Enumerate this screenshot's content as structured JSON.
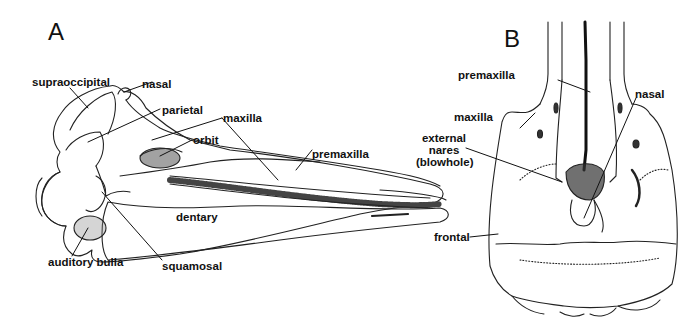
{
  "figure": {
    "panels": [
      {
        "id": "A",
        "view": "lateral",
        "labels": {
          "supraoccipital": "supraoccipital",
          "nasal": "nasal",
          "parietal": "parietal",
          "maxilla": "maxilla",
          "orbit": "orbit",
          "premaxilla": "premaxilla",
          "dentary": "dentary",
          "auditory_bulla": "auditory bulla",
          "squamosal": "squamosal"
        }
      },
      {
        "id": "B",
        "view": "dorsal",
        "labels": {
          "premaxilla": "premaxilla",
          "maxilla": "maxilla",
          "nasal": "nasal",
          "external_nares_1": "external",
          "external_nares_2": "nares",
          "external_nares_3": "(blowhole)",
          "frontal": "frontal"
        }
      }
    ]
  }
}
